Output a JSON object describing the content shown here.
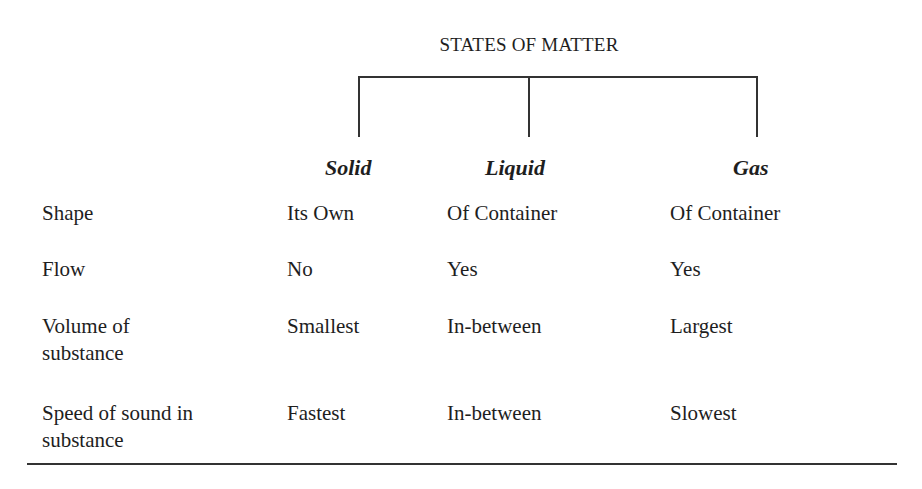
{
  "title": "STATES OF MATTER",
  "columns": [
    "Solid",
    "Liquid",
    "Gas"
  ],
  "rows": [
    {
      "label": [
        "Shape"
      ],
      "values": [
        "Its Own",
        "Of Container",
        "Of Container"
      ]
    },
    {
      "label": [
        "Flow"
      ],
      "values": [
        "No",
        "Yes",
        "Yes"
      ]
    },
    {
      "label": [
        "Volume of",
        "substance"
      ],
      "values": [
        "Smallest",
        "In-between",
        "Largest"
      ]
    },
    {
      "label": [
        "Speed of sound in",
        "substance"
      ],
      "values": [
        "Fastest",
        "In-between",
        "Slowest"
      ]
    }
  ]
}
